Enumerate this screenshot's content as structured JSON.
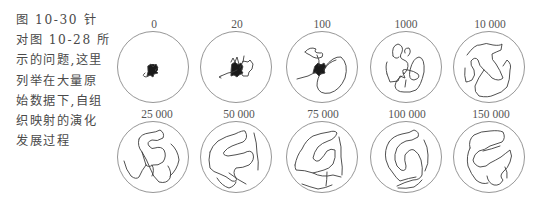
{
  "caption": {
    "figure_number": "图 10-30",
    "lines": [
      "图 10-30 针",
      "对图 10-28 所",
      "示的问题,这里",
      "列举在大量原",
      "始数据下,自组",
      "织映射的演化",
      "发展过程"
    ]
  },
  "figure": {
    "panels": [
      {
        "label": "0"
      },
      {
        "label": "20"
      },
      {
        "label": "100"
      },
      {
        "label": "1000"
      },
      {
        "label": "10 000"
      },
      {
        "label": "25 000"
      },
      {
        "label": "50 000"
      },
      {
        "label": "75 000"
      },
      {
        "label": "100 000"
      },
      {
        "label": "150 000"
      }
    ],
    "colors": {
      "circle": "#8a8a8a",
      "path": "#444444",
      "text": "#555555"
    }
  }
}
